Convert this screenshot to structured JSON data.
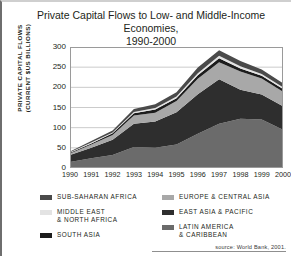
{
  "title": {
    "line1": "Private Capital Flows to Low- and Middle-Income Economies,",
    "line2": "1990-2000"
  },
  "axes": {
    "ylabel_line1": "PRIVATE CAPITAL FLOWS",
    "ylabel_line2": "(CURRENT $US BILLIONS)",
    "yticks": [
      "300",
      "250",
      "200",
      "150",
      "100",
      "50",
      "0"
    ],
    "xticks": [
      "1990",
      "1991",
      "1992",
      "1993",
      "1994",
      "1995",
      "1996",
      "1997",
      "1998",
      "1999",
      "2000"
    ]
  },
  "legend": {
    "left": [
      {
        "label": "SUB-SAHARAN AFRICA",
        "color": "#4a4a4a"
      },
      {
        "label": "MIDDLE EAST\n& NORTH  AFRICA",
        "color": "#e3e3e3"
      },
      {
        "label": "SOUTH ASIA",
        "color": "#1c1c1c"
      }
    ],
    "right": [
      {
        "label": "EUROPE & CENTRAL ASIA",
        "color": "#a8a8a8"
      },
      {
        "label": "EAST ASIA & PACIFIC",
        "color": "#2e2e2e"
      },
      {
        "label": "LATIN AMERICA\n& CARIBBEAN",
        "color": "#6b6b6b"
      }
    ]
  },
  "source": "source: World Bank, 2001.",
  "chart_data": {
    "type": "area",
    "stacked": true,
    "title": "Private Capital Flows to Low- and Middle-Income Economies, 1990-2000",
    "xlabel": "",
    "ylabel": "PRIVATE CAPITAL FLOWS (CURRENT $US BILLIONS)",
    "x": [
      "1990",
      "1991",
      "1992",
      "1993",
      "1994",
      "1995",
      "1996",
      "1997",
      "1998",
      "1999",
      "2000"
    ],
    "ylim": [
      0,
      300
    ],
    "yticks": [
      0,
      50,
      100,
      150,
      200,
      250,
      300
    ],
    "grid": true,
    "legend_position": "below",
    "series": [
      {
        "name": "LATIN AMERICA & CARIBBEAN",
        "color": "#6b6b6b",
        "values": [
          15,
          24,
          32,
          52,
          50,
          58,
          85,
          110,
          122,
          120,
          95
        ]
      },
      {
        "name": "EAST ASIA & PACIFIC",
        "color": "#2e2e2e",
        "values": [
          17,
          26,
          38,
          58,
          65,
          80,
          98,
          110,
          72,
          62,
          58
        ]
      },
      {
        "name": "EUROPE & CENTRAL ASIA",
        "color": "#a8a8a8",
        "values": [
          4,
          8,
          12,
          20,
          22,
          28,
          38,
          42,
          45,
          40,
          36
        ]
      },
      {
        "name": "SOUTH ASIA",
        "color": "#1c1c1c",
        "values": [
          2,
          3,
          4,
          6,
          8,
          7,
          9,
          10,
          8,
          7,
          7
        ]
      },
      {
        "name": "MIDDLE EAST & NORTH AFRICA",
        "color": "#e3e3e3",
        "values": [
          1,
          2,
          2,
          3,
          4,
          4,
          5,
          6,
          5,
          4,
          4
        ]
      },
      {
        "name": "SUB-SAHARAN AFRICA",
        "color": "#4a4a4a",
        "values": [
          2,
          4,
          5,
          7,
          9,
          11,
          14,
          14,
          13,
          11,
          10
        ]
      }
    ],
    "totals": [
      41,
      67,
      93,
      146,
      158,
      188,
      249,
      292,
      265,
      244,
      210
    ]
  }
}
